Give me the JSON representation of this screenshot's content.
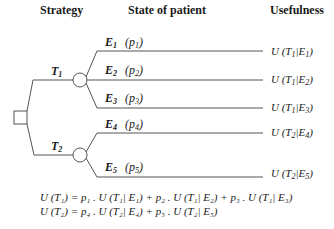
{
  "headers": {
    "strategy": "Strategy",
    "state": "State of patient",
    "usefulness": "Usefulness"
  },
  "strategies": [
    {
      "label": "T",
      "sub": "1"
    },
    {
      "label": "T",
      "sub": "2"
    }
  ],
  "events": [
    {
      "label": "E",
      "sub": "1",
      "prob": "(p",
      "prob_sub": "1",
      "prob_end": ")",
      "utility": "U (T",
      "u_t": "1",
      "u_mid": "|E",
      "u_e": "1",
      "u_end": ")"
    },
    {
      "label": "E",
      "sub": "2",
      "prob": "(p",
      "prob_sub": "2",
      "prob_end": ")",
      "utility": "U (T",
      "u_t": "1",
      "u_mid": "|E",
      "u_e": "2",
      "u_end": ")"
    },
    {
      "label": "E",
      "sub": "3",
      "prob": "(p",
      "prob_sub": "3",
      "prob_end": ")",
      "utility": "U (T",
      "u_t": "1",
      "u_mid": "|E",
      "u_e": "3",
      "u_end": ")"
    },
    {
      "label": "E",
      "sub": "4",
      "prob": "(p",
      "prob_sub": "4",
      "prob_end": ")",
      "utility": "U (T",
      "u_t": "2",
      "u_mid": "|E",
      "u_e": "4",
      "u_end": ")"
    },
    {
      "label": "E",
      "sub": "5",
      "prob": "(p",
      "prob_sub": "5",
      "prob_end": ")",
      "utility": "U (T",
      "u_t": "2",
      "u_mid": "|E",
      "u_e": "5",
      "u_end": ")"
    }
  ],
  "formulas": [
    "U (T₁) = p₁ . U (T₁| E₁) + p₂ . U (T₁| E₂) + p₃ . U (T₁| E₃)",
    "U (T₂) = p₄ . U (T₂| E₄) + p₅ . U (T₂| E₅)"
  ],
  "colors": {
    "line": "#555555",
    "text": "#1a1a1a"
  }
}
